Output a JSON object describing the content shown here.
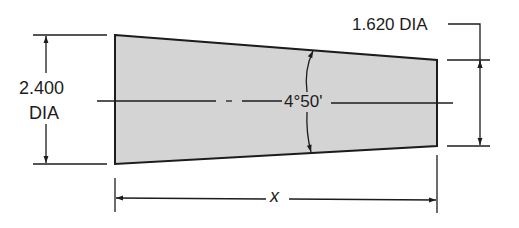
{
  "drawing": {
    "type": "tapered shaft dimension drawing",
    "shape": {
      "fill": "#d4d4d4",
      "stroke": "#1c1c1c",
      "large_end_points": [
        [
          115,
          35
        ],
        [
          115,
          164
        ]
      ],
      "small_end_points": [
        [
          437,
          60
        ],
        [
          437,
          146
        ]
      ]
    },
    "dimensions": {
      "large_diameter": {
        "value": "2.400",
        "unit_label": "DIA"
      },
      "small_diameter": {
        "label": "1.620 DIA"
      },
      "taper_angle": {
        "label": "4°50'"
      },
      "length": {
        "label": "x"
      }
    }
  }
}
